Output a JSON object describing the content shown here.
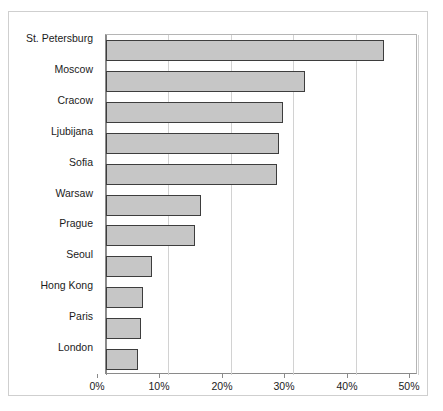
{
  "chart_data": {
    "type": "bar",
    "orientation": "horizontal",
    "title": "",
    "subtitle": "",
    "xlabel": "",
    "ylabel": "",
    "xlim": [
      0,
      50
    ],
    "xtick_labels": [
      "0%",
      "10%",
      "20%",
      "30%",
      "40%",
      "50%"
    ],
    "xticks": [
      0,
      10,
      20,
      30,
      40,
      50
    ],
    "grid": true,
    "legend": false,
    "value_suffix": "%",
    "categories": [
      "St. Petersburg",
      "Moscow",
      "Cracow",
      "Ljubijana",
      "Sofia",
      "Warsaw",
      "Prague",
      "Seoul",
      "Hong Kong",
      "Paris",
      "London"
    ],
    "values": [
      44.5,
      31.9,
      28.4,
      27.8,
      27.4,
      15.3,
      14.2,
      7.3,
      5.9,
      5.6,
      5.2
    ],
    "bars": [
      {
        "label": "St. Petersburg",
        "value": 44.5
      },
      {
        "label": "Moscow",
        "value": 31.9
      },
      {
        "label": "Cracow",
        "value": 28.4
      },
      {
        "label": "Ljubijana",
        "value": 27.8
      },
      {
        "label": "Sofia",
        "value": 27.4
      },
      {
        "label": "Warsaw",
        "value": 15.3
      },
      {
        "label": "Prague",
        "value": 14.2
      },
      {
        "label": "Seoul",
        "value": 7.3
      },
      {
        "label": "Hong Kong",
        "value": 5.9
      },
      {
        "label": "Paris",
        "value": 5.6
      },
      {
        "label": "London",
        "value": 5.2
      }
    ]
  },
  "style": {
    "bar_fill": "#c6c6c6",
    "bar_border": "#3d3d3d",
    "gridline_color": "#d2d2d2",
    "axis_color": "#8a8a8a",
    "frame_color": "#cfcfcf",
    "text_color": "#1b1b1b",
    "background": "#ffffff"
  }
}
